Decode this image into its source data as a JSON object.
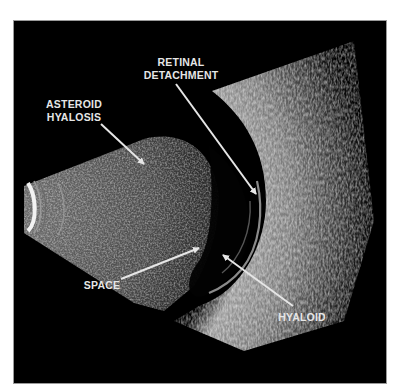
{
  "figure": {
    "type": "ocular B-scan ultrasound",
    "background_color": "#000000",
    "border_color": "#9a9a9a",
    "label_color": "#e6e6e6"
  },
  "labels": {
    "retinal_detachment": {
      "line1": "RETINAL",
      "line2": "DETACHMENT"
    },
    "asteroid_hyalosis": {
      "line1": "ASTEROID",
      "line2": "HYALOSIS"
    },
    "space": {
      "text": "SPACE"
    },
    "hyaloid": {
      "text": "HYALOID"
    }
  },
  "arrows": [
    {
      "name": "retinal-detachment-arrow",
      "from": [
        175,
        83
      ],
      "to": [
        255,
        193
      ]
    },
    {
      "name": "asteroid-hyalosis-arrow",
      "from": [
        100,
        123
      ],
      "to": [
        143,
        163
      ]
    },
    {
      "name": "space-arrow",
      "from": [
        120,
        278
      ],
      "to": [
        198,
        247
      ]
    },
    {
      "name": "hyaloid-arrow",
      "from": [
        292,
        305
      ],
      "to": [
        222,
        254
      ]
    }
  ]
}
